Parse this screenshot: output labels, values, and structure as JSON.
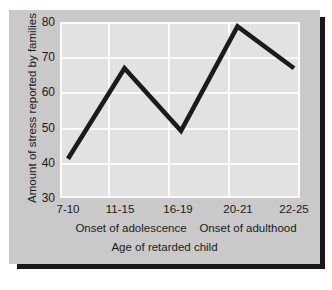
{
  "chart_data": {
    "type": "line",
    "title": "",
    "xlabel": "Age of retarded child",
    "ylabel": "Amount of stress reported by families",
    "categories": [
      "7-10",
      "11-15",
      "16-19",
      "20-21",
      "22-25"
    ],
    "values": [
      41,
      67,
      49,
      79,
      67
    ],
    "series": [
      {
        "name": "Amount of stress reported by families",
        "values": [
          41,
          67,
          49,
          79,
          67
        ]
      }
    ],
    "ylim": [
      30,
      80
    ],
    "yticks": [
      30,
      40,
      50,
      60,
      70,
      80
    ],
    "xticks": [
      "7-10",
      "11-15",
      "16-19",
      "20-21",
      "22-25"
    ],
    "grid": true,
    "legend": false,
    "legend_position": "none",
    "annotations": [
      {
        "text": "Onset of adolescence",
        "between": [
          "11-15",
          "16-19"
        ]
      },
      {
        "text": "Onset of adulthood",
        "between": [
          "20-21",
          "22-25"
        ]
      }
    ],
    "colors": {
      "line": "#1b1b1b",
      "plot_background": "#e2e2e2",
      "gridline": "#fbfbfb",
      "card_background": "#c9c9c9",
      "shadow": "#18181a",
      "text": "#1b1b1b"
    }
  }
}
